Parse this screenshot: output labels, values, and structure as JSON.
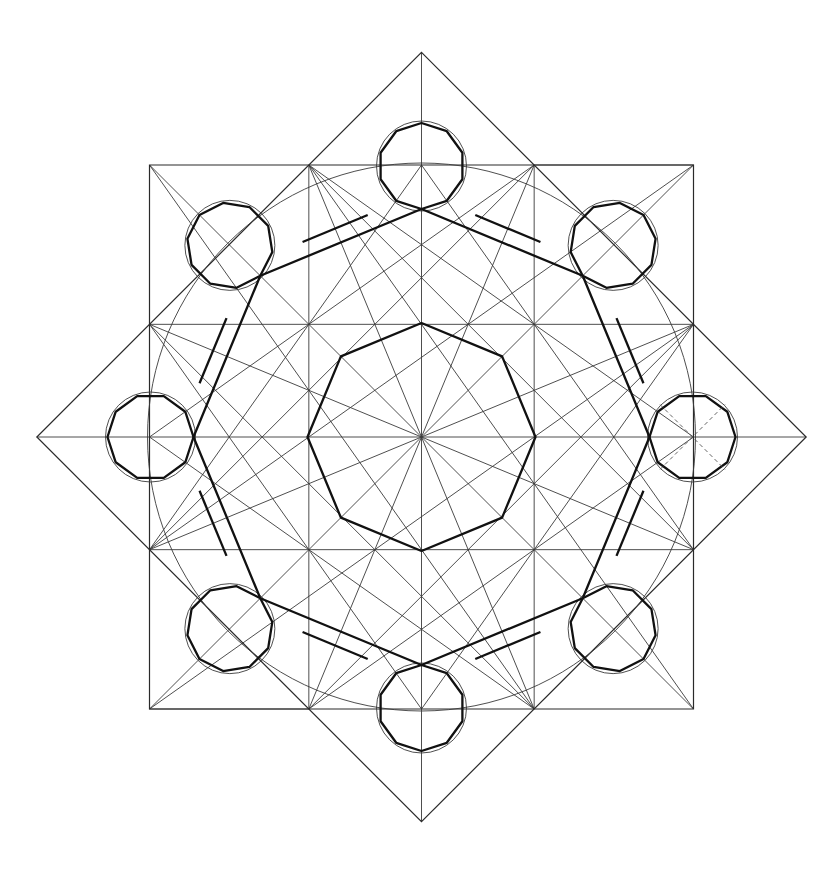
{
  "figure": {
    "title": "",
    "colors": {
      "background": "#ffffff",
      "construction_line": "#3a3a3a",
      "outline": "#111111"
    },
    "elements": {
      "outer_square": {
        "label": "square"
      },
      "rotated_square": {
        "label": "rotated square (diamond)"
      },
      "circumscribed_circle": {
        "label": "large circle"
      },
      "inner_octagon": {
        "label": "inner octagon",
        "sides": 8
      },
      "band": {
        "label": "octagonal band",
        "sides": 8
      },
      "corner_circles": {
        "label": "small circles",
        "count": 8
      },
      "corner_polygons": {
        "label": "small decagons",
        "count": 8,
        "sides": 10
      },
      "dashed_guides": {
        "label": "dashed diagonals in right circle",
        "count": 2
      }
    }
  }
}
